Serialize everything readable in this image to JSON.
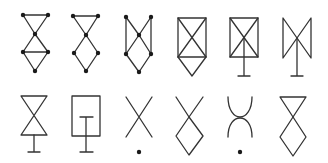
{
  "figure": {
    "stroke_color": "#333333",
    "dot_color": "#1a1a1a",
    "background": "#ffffff",
    "rows": [
      {
        "row": 1,
        "symbols": [
          {
            "id": 1,
            "type": "graph",
            "shape": "bowtie-over-diamond with horizontal bar and vertices dotted"
          },
          {
            "id": 2,
            "type": "graph",
            "shape": "triangle-over-diamond with vertices dotted"
          },
          {
            "id": 3,
            "type": "graph",
            "shape": "N-shaped lattice with side edges and vertices dotted"
          },
          {
            "id": 4,
            "type": "symbol",
            "shape": "crossed rectangle over downward triangle"
          },
          {
            "id": 5,
            "type": "symbol",
            "shape": "crossed rectangle with T stem"
          },
          {
            "id": 6,
            "type": "symbol",
            "shape": "vertical bowtie with T stem"
          }
        ]
      },
      {
        "row": 2,
        "symbols": [
          {
            "id": 7,
            "type": "symbol",
            "shape": "hourglass with T stem"
          },
          {
            "id": 8,
            "type": "symbol",
            "shape": "rectangle with inner T stem"
          },
          {
            "id": 9,
            "type": "symbol",
            "shape": "X with dot below"
          },
          {
            "id": 10,
            "type": "symbol",
            "shape": "X over diamond"
          },
          {
            "id": 11,
            "type": "symbol",
            "shape": "two touching arcs with dot below"
          },
          {
            "id": 12,
            "type": "symbol",
            "shape": "triangle over diamond"
          }
        ]
      }
    ]
  }
}
